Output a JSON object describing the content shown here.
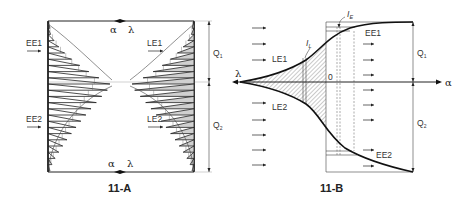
{
  "figure_a": {
    "caption": "11-A",
    "inlet_labels": [
      "EE1",
      "EE2"
    ],
    "outlet_labels": [
      "LE1",
      "LE2"
    ],
    "top_marker": {
      "left": "α",
      "right": "λ"
    },
    "bottom_marker": {
      "left": "α",
      "right": "λ"
    },
    "dimension_labels": [
      "Q1",
      "Q2"
    ]
  },
  "figure_b": {
    "caption": "11-B",
    "axis_left_label": "λ",
    "axis_right_label": "α",
    "origin_label": "0",
    "curve_labels": [
      "LE1",
      "LE2",
      "EE1",
      "EE2"
    ],
    "marker_labels": {
      "I_L": "I",
      "I_L_sub": "L",
      "I_E": "I",
      "I_E_sub": "E"
    },
    "dimension_labels": [
      "Q1",
      "Q2"
    ]
  },
  "colors": {
    "line": "#222222",
    "shade": "#d0d0d0",
    "background": "#ffffff"
  }
}
